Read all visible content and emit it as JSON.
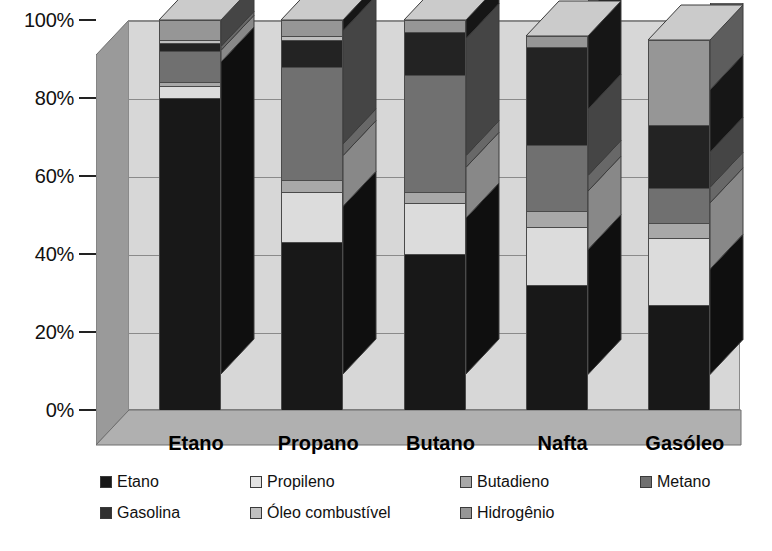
{
  "chart_data": {
    "type": "bar",
    "subtype": "stacked-100-percent-3d",
    "title": "",
    "xlabel": "",
    "ylabel": "",
    "ylim": [
      0,
      100
    ],
    "y_tick_labels": [
      "0%",
      "20%",
      "40%",
      "60%",
      "80%",
      "100%"
    ],
    "y_tick_values": [
      0,
      20,
      40,
      60,
      80,
      100
    ],
    "grid": true,
    "legend_position": "bottom",
    "categories": [
      "Etano",
      "Propano",
      "Butano",
      "Nafta",
      "Gasóleo"
    ],
    "series": [
      {
        "name": "Etano",
        "color": "#181818",
        "values": [
          80,
          43,
          40,
          32,
          27
        ]
      },
      {
        "name": "Propileno",
        "color": "#dcdcdc",
        "values": [
          3,
          13,
          13,
          15,
          17
        ]
      },
      {
        "name": "Butadieno",
        "color": "#a8a8a8",
        "values": [
          1,
          3,
          3,
          4,
          4
        ]
      },
      {
        "name": "Metano",
        "color": "#707070",
        "values": [
          8,
          29,
          30,
          17,
          9
        ]
      },
      {
        "name": "Gasolina",
        "color": "#232323",
        "values": [
          2,
          7,
          11,
          25,
          16
        ]
      },
      {
        "name": "Óleo combustível",
        "color": "#c0c0c0",
        "values": [
          1,
          1,
          0,
          0,
          0
        ]
      },
      {
        "name": "Hidrogênio",
        "color": "#969696",
        "values": [
          5,
          4,
          3,
          3,
          22
        ]
      }
    ]
  },
  "legend": {
    "rows": [
      [
        {
          "label": "Etano",
          "color": "#181818"
        },
        {
          "label": "Propileno",
          "color": "#e2e2e2"
        },
        {
          "label": "Butadieno",
          "color": "#a8a8a8"
        },
        {
          "label": "Metano",
          "color": "#707070"
        }
      ],
      [
        {
          "label": "Gasolina",
          "color": "#303030"
        },
        {
          "label": "Óleo combustível",
          "color": "#c0c0c0"
        },
        {
          "label": "Hidrogênio",
          "color": "#969696"
        }
      ]
    ]
  },
  "colors": {
    "plot_background": "#d7d7d7",
    "side_wall": "#9a9a9a",
    "floor": "#b0b0b0",
    "gridline": "#8a8a8a",
    "axis": "#222222",
    "page_background": "#ffffff"
  }
}
